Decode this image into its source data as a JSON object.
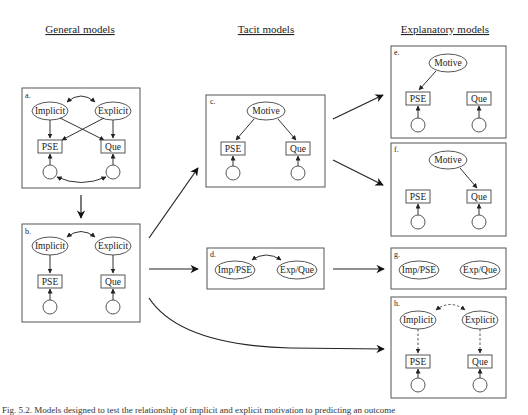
{
  "headings": {
    "general": "General models",
    "tacit": "Tacit models",
    "explanatory": "Explanatory models"
  },
  "panels": {
    "a": {
      "label": "a.",
      "implicit": "Implicit",
      "explicit": "Explicit",
      "pse": "PSE",
      "que": "Que"
    },
    "b": {
      "label": "b.",
      "implicit": "Implicit",
      "explicit": "Explicit",
      "pse": "PSE",
      "que": "Que"
    },
    "c": {
      "label": "c.",
      "motive": "Motive",
      "pse": "PSE",
      "que": "Que"
    },
    "d": {
      "label": "d.",
      "imp_pse": "Imp/PSE",
      "exp_que": "Exp/Que"
    },
    "e": {
      "label": "e.",
      "motive": "Motive",
      "pse": "PSE",
      "que": "Que"
    },
    "f": {
      "label": "f.",
      "motive": "Motive",
      "pse": "PSE",
      "que": "Que"
    },
    "g": {
      "label": "g.",
      "imp_pse": "Imp/PSE",
      "exp_que": "Exp/Que"
    },
    "h": {
      "label": "h.",
      "implicit": "Implicit",
      "explicit": "Explicit",
      "pse": "PSE",
      "que": "Que"
    }
  },
  "caption": "Fig. 5.2. Models designed to test the relationship of implicit and explicit motivation to predicting an outcome"
}
